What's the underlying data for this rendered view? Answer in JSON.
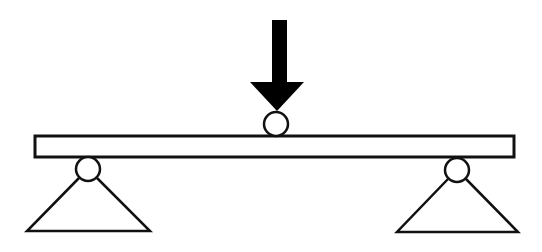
{
  "diagram": {
    "type": "simply-supported-beam",
    "description": "Three-point bending: simply supported beam with a central point load",
    "colors": {
      "stroke": "#111111",
      "fill_beam": "#ffffff",
      "fill_arrow": "#000000",
      "background": "#ffffff"
    },
    "beam": {
      "x": 35,
      "y": 136,
      "width": 479,
      "height": 21
    },
    "load": {
      "name": "point-load-arrow",
      "shaft": {
        "x": 272,
        "y": 20,
        "width": 15,
        "height": 63
      },
      "head": {
        "left": 250,
        "right": 304,
        "top": 82,
        "tip_x": 277,
        "tip_y": 111
      },
      "roller": {
        "cx": 276,
        "cy": 124,
        "r": 12
      }
    },
    "supports": [
      {
        "name": "left-support",
        "roller": {
          "cx": 88,
          "cy": 169,
          "r": 12
        },
        "triangle": {
          "apex_left_x": 79,
          "apex_right_x": 97,
          "apex_y": 178,
          "base_left_x": 27,
          "base_right_x": 150,
          "base_y": 231
        }
      },
      {
        "name": "right-support",
        "roller": {
          "cx": 457,
          "cy": 170,
          "r": 12
        },
        "triangle": {
          "apex_left_x": 448,
          "apex_right_x": 466,
          "apex_y": 179,
          "base_left_x": 397,
          "base_right_x": 518,
          "base_y": 232
        }
      }
    ]
  }
}
